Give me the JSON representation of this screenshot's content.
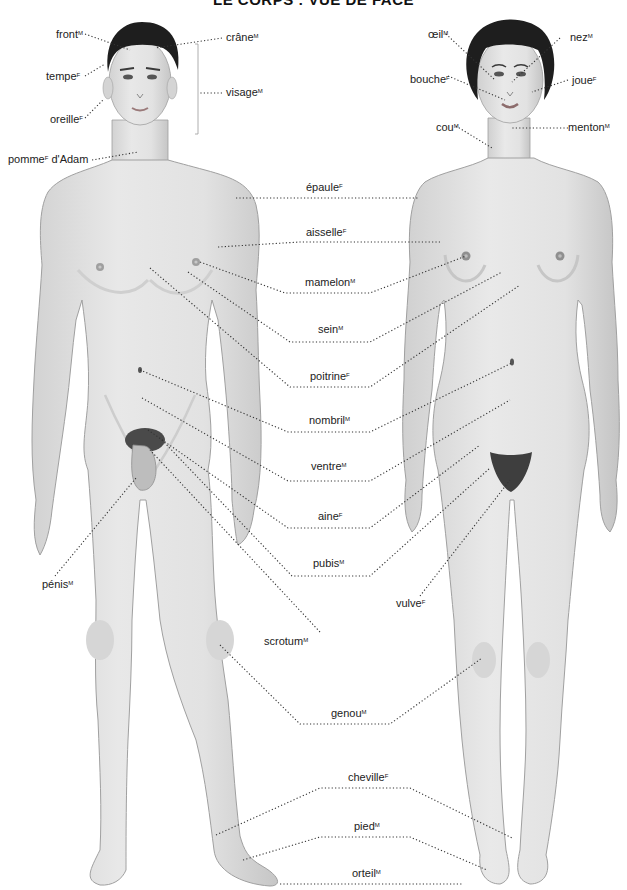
{
  "page": {
    "title": "LE CORPS : VUE DE FACE"
  },
  "figures": {
    "male": "male-body-front",
    "female": "female-body-front"
  },
  "labels": {
    "front": {
      "text": "front",
      "gender": "M"
    },
    "crane": {
      "text": "crâne",
      "gender": "M"
    },
    "tempe": {
      "text": "tempe",
      "gender": "F"
    },
    "visage": {
      "text": "visage",
      "gender": "M"
    },
    "oreille": {
      "text": "oreille",
      "gender": "F"
    },
    "pomme_adam": {
      "text": "pomme",
      "gender": "F",
      "suffix": " d'Adam"
    },
    "oeil": {
      "text": "œil",
      "gender": "M"
    },
    "nez": {
      "text": "nez",
      "gender": "M"
    },
    "bouche": {
      "text": "bouche",
      "gender": "F"
    },
    "joue": {
      "text": "joue",
      "gender": "F"
    },
    "cou": {
      "text": "cou",
      "gender": "M"
    },
    "menton": {
      "text": "menton",
      "gender": "M"
    },
    "epaule": {
      "text": "épaule",
      "gender": "F"
    },
    "aisselle": {
      "text": "aisselle",
      "gender": "F"
    },
    "mamelon": {
      "text": "mamelon",
      "gender": "M"
    },
    "sein": {
      "text": "sein",
      "gender": "M"
    },
    "poitrine": {
      "text": "poitrine",
      "gender": "F"
    },
    "nombril": {
      "text": "nombril",
      "gender": "M"
    },
    "ventre": {
      "text": "ventre",
      "gender": "M"
    },
    "aine": {
      "text": "aine",
      "gender": "F"
    },
    "pubis": {
      "text": "pubis",
      "gender": "M"
    },
    "penis": {
      "text": "pénis",
      "gender": "M"
    },
    "vulve": {
      "text": "vulve",
      "gender": "F"
    },
    "scrotum": {
      "text": "scrotum",
      "gender": "M"
    },
    "genou": {
      "text": "genou",
      "gender": "M"
    },
    "cheville": {
      "text": "cheville",
      "gender": "F"
    },
    "pied": {
      "text": "pied",
      "gender": "M"
    },
    "orteil": {
      "text": "orteil",
      "gender": "M"
    }
  },
  "colors": {
    "skin": "#e4e4e4",
    "skin_shadow": "#c9c9c9",
    "outline": "#9a9a9a",
    "hair": "#1e1e1e",
    "leader": "#333333",
    "text": "#222222"
  }
}
